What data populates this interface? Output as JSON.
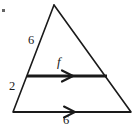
{
  "figure": {
    "kind": "geometry-diagram",
    "canvas": {
      "width": 138,
      "height": 129,
      "background": "#ffffff"
    },
    "stroke_color": "#1a1a1a",
    "labels": {
      "side_upper_left": "6",
      "side_lower_left": "2",
      "vector_midsegment": "f",
      "base": "6"
    },
    "geometry": {
      "apex": {
        "x": 54,
        "y": 5
      },
      "bottom_left": {
        "x": 13,
        "y": 112
      },
      "bottom_right": {
        "x": 131,
        "y": 112
      },
      "midsegment_left": {
        "x": 27,
        "y": 76
      },
      "midsegment_right": {
        "x": 107,
        "y": 76
      },
      "midsegment_arrow_tip": {
        "x": 72,
        "y": 76
      },
      "base_arrow_tip": {
        "x": 74,
        "y": 112
      }
    },
    "strokes": {
      "triangle_width": 1.6,
      "midsegment_width": 3.0,
      "base_width": 2.0
    },
    "speck": {
      "x": 2,
      "y": 9,
      "size": 3,
      "color": "#4a4a4a"
    }
  }
}
